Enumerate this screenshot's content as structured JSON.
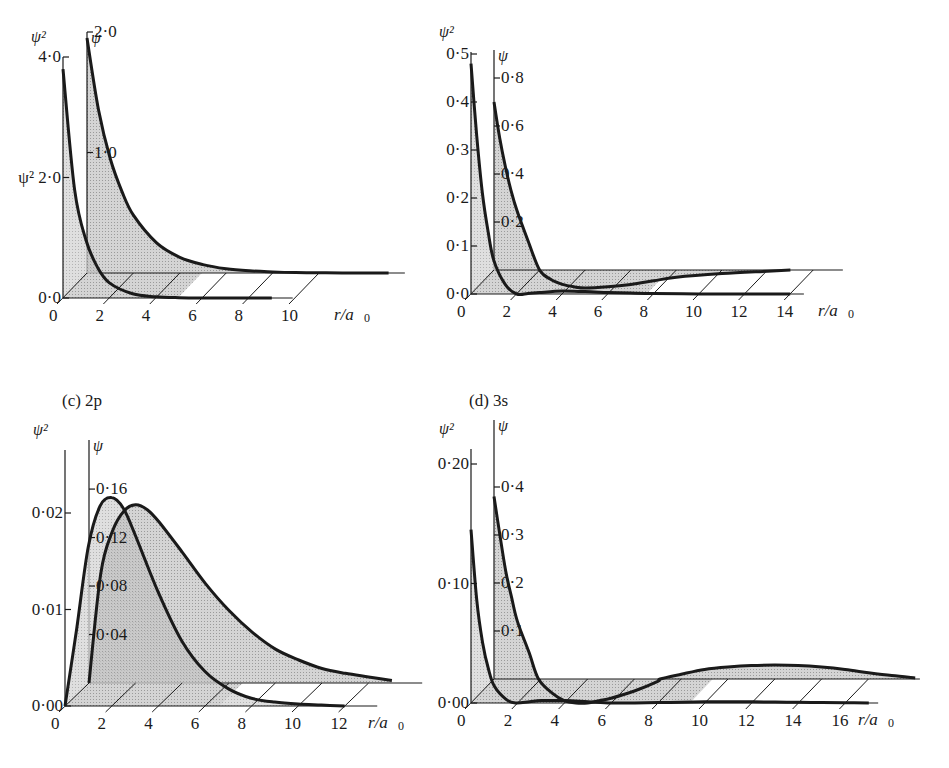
{
  "figure": {
    "panels": [
      {
        "id": "a",
        "title": "",
        "orbital": "1s"
      },
      {
        "id": "b",
        "title": "",
        "orbital": "2s"
      },
      {
        "id": "c",
        "title": "(c)  2p",
        "orbital": "2p"
      },
      {
        "id": "d",
        "title": "(d)  3s",
        "orbital": "3s"
      }
    ]
  },
  "chart_data": [
    {
      "type": "area",
      "panel": "a",
      "title": "1s",
      "xlabel": "r/a0",
      "x_ticks": [
        0,
        2,
        4,
        6,
        8,
        10
      ],
      "axes": {
        "psi_squared": {
          "label": "ψ²",
          "ticks": [
            0.0,
            2.0,
            4.0
          ],
          "tick_labels": [
            "0·0",
            "ψ² 2·0",
            "4·0"
          ],
          "range": [
            0,
            4.0
          ]
        },
        "psi": {
          "label": "ψ",
          "ticks": [
            1.0,
            2.0
          ],
          "tick_labels": [
            "1·0",
            "2·0"
          ],
          "range": [
            0,
            2.0
          ]
        }
      },
      "series": [
        {
          "name": "ψ²",
          "r": [
            0,
            0.5,
            1,
            1.5,
            2,
            3,
            4,
            5,
            6,
            7,
            8,
            9
          ],
          "values": [
            3.8,
            1.8,
            0.95,
            0.5,
            0.25,
            0.07,
            0.02,
            0.005,
            0.001,
            0,
            0,
            0
          ]
        },
        {
          "name": "ψ",
          "r": [
            0,
            0.5,
            1,
            1.5,
            2,
            3,
            4,
            5,
            6,
            7,
            8,
            9,
            10,
            11,
            13
          ],
          "values": [
            1.95,
            1.35,
            0.95,
            0.68,
            0.48,
            0.25,
            0.13,
            0.07,
            0.035,
            0.018,
            0.009,
            0.004,
            0.002,
            0.001,
            0
          ]
        }
      ]
    },
    {
      "type": "area",
      "panel": "b",
      "title": "2s",
      "xlabel": "r/a0",
      "x_ticks": [
        0,
        2,
        4,
        6,
        8,
        10,
        12,
        14
      ],
      "axes": {
        "psi_squared": {
          "label": "ψ²",
          "ticks": [
            0.0,
            0.1,
            0.2,
            0.3,
            0.4,
            0.5
          ],
          "tick_labels": [
            "0·0",
            "0·1",
            "0·2",
            "0·3",
            "0·4",
            "0·5"
          ],
          "range": [
            0,
            0.5
          ]
        },
        "psi": {
          "label": "ψ",
          "ticks": [
            0.2,
            0.4,
            0.6,
            0.8
          ],
          "tick_labels": [
            "0·2",
            "0·4",
            "0·6",
            "0·8"
          ],
          "range": [
            0,
            0.9
          ]
        }
      },
      "series": [
        {
          "name": "ψ²",
          "r": [
            0,
            0.25,
            0.5,
            0.75,
            1,
            1.5,
            2,
            2.5,
            3,
            4,
            5,
            6,
            7,
            8,
            10,
            12,
            14
          ],
          "values": [
            0.48,
            0.33,
            0.21,
            0.13,
            0.07,
            0.02,
            0.0,
            0.001,
            0.003,
            0.006,
            0.005,
            0.003,
            0.002,
            0.001,
            0.0,
            0.0,
            0.0
          ]
        },
        {
          "name": "ψ",
          "r": [
            0,
            0.25,
            0.5,
            0.75,
            1,
            1.5,
            2,
            2.5,
            3,
            3.5,
            4,
            5,
            6,
            7,
            8,
            10,
            12,
            13
          ],
          "values": [
            0.7,
            0.55,
            0.43,
            0.33,
            0.25,
            0.12,
            0.0,
            -0.04,
            -0.06,
            -0.07,
            -0.075,
            -0.07,
            -0.06,
            -0.045,
            -0.03,
            -0.015,
            -0.005,
            0.0
          ]
        }
      ]
    },
    {
      "type": "area",
      "panel": "c",
      "title": "(c) 2p",
      "xlabel": "r/a0",
      "x_ticks": [
        0,
        2,
        4,
        6,
        8,
        10,
        12
      ],
      "axes": {
        "psi_squared": {
          "label": "ψ²",
          "ticks": [
            0.0,
            0.01,
            0.02
          ],
          "tick_labels": [
            "0·00",
            "0·01",
            "0·02"
          ],
          "range": [
            0,
            0.025
          ]
        },
        "psi": {
          "label": "ψ",
          "ticks": [
            0.04,
            0.08,
            0.12,
            0.16
          ],
          "tick_labels": [
            "0·04",
            "0·08",
            "0·12",
            "0·16"
          ],
          "range": [
            0,
            0.2
          ]
        }
      },
      "series": [
        {
          "name": "ψ²",
          "r": [
            0,
            0.5,
            1,
            1.5,
            2,
            2.5,
            3,
            4,
            5,
            6,
            7,
            8,
            9,
            10,
            11,
            12
          ],
          "values": [
            0.0,
            0.008,
            0.0165,
            0.0207,
            0.0216,
            0.0205,
            0.0178,
            0.0118,
            0.0068,
            0.0036,
            0.0018,
            0.0008,
            0.0004,
            0.0002,
            0.0001,
            0.0
          ]
        },
        {
          "name": "ψ",
          "r": [
            0,
            0.5,
            1,
            1.5,
            2,
            2.5,
            3,
            4,
            5,
            6,
            7,
            8,
            9,
            10,
            11,
            12,
            13
          ],
          "values": [
            0.0,
            0.09,
            0.125,
            0.142,
            0.147,
            0.143,
            0.133,
            0.108,
            0.082,
            0.06,
            0.042,
            0.028,
            0.019,
            0.012,
            0.008,
            0.005,
            0.002
          ]
        }
      ]
    },
    {
      "type": "area",
      "panel": "d",
      "title": "(d) 3s",
      "xlabel": "r/a0",
      "x_ticks": [
        0,
        2,
        4,
        6,
        8,
        10,
        12,
        14,
        16
      ],
      "axes": {
        "psi_squared": {
          "label": "ψ²",
          "ticks": [
            0.0,
            0.1,
            0.2
          ],
          "tick_labels": [
            "0·00",
            "0·10",
            "0·20"
          ],
          "range": [
            0,
            0.2
          ]
        },
        "psi": {
          "label": "ψ",
          "ticks": [
            0.1,
            0.2,
            0.3,
            0.4
          ],
          "tick_labels": [
            "0·1",
            "0·2",
            "0·3",
            "0·4"
          ],
          "range": [
            0,
            0.45
          ]
        }
      },
      "series": [
        {
          "name": "ψ²",
          "r": [
            0,
            0.25,
            0.5,
            0.75,
            1,
            1.5,
            1.9,
            2.5,
            3,
            4,
            5,
            6,
            7,
            8,
            9,
            10,
            11,
            12,
            13,
            14,
            15,
            16,
            17
          ],
          "values": [
            0.145,
            0.085,
            0.05,
            0.028,
            0.014,
            0.003,
            0.0,
            0.001,
            0.002,
            0.002,
            0.001,
            0.0,
            0.0,
            0.0003,
            0.0007,
            0.001,
            0.0011,
            0.001,
            0.0008,
            0.0006,
            0.0004,
            0.0002,
            0.0
          ]
        },
        {
          "name": "ψ",
          "r": [
            0,
            0.25,
            0.5,
            0.75,
            1,
            1.5,
            1.9,
            2.5,
            3,
            3.5,
            4,
            4.5,
            5,
            6,
            7,
            7.1,
            8,
            9,
            10,
            11,
            12,
            13,
            14,
            15,
            16,
            17,
            18
          ],
          "values": [
            0.38,
            0.3,
            0.225,
            0.17,
            0.12,
            0.055,
            0.0,
            -0.03,
            -0.045,
            -0.05,
            -0.05,
            -0.045,
            -0.04,
            -0.025,
            -0.005,
            0.0,
            0.01,
            0.02,
            0.025,
            0.028,
            0.029,
            0.028,
            0.025,
            0.02,
            0.013,
            0.007,
            0.002
          ]
        }
      ]
    }
  ],
  "layout": {
    "panels": [
      {
        "front": [
          63,
          298
        ],
        "back": [
          87,
          273
        ],
        "rpx": 23.2,
        "sq_px": 60.25,
        "psi_px": 120.5,
        "axis_top_sq": 57,
        "axis_top_psi": 32,
        "front_len": 9.9,
        "back_len": 13.7,
        "xlabel_pos": [
          334,
          306
        ]
      },
      {
        "front": [
          471,
          294
        ],
        "back": [
          494,
          270
        ],
        "rpx": 22.8,
        "sq_px": 480,
        "psi_px": 240,
        "axis_top_sq": 52,
        "axis_top_psi": 50,
        "front_len": 14.6,
        "back_len": 15.3,
        "xlabel_pos": [
          818,
          302
        ]
      },
      {
        "front": [
          65,
          706
        ],
        "back": [
          89,
          683
        ],
        "rpx": 23.3,
        "sq_px": 9650,
        "psi_px": 1212,
        "axis_top_sq": 450,
        "axis_top_psi": 440,
        "front_len": 13.4,
        "back_len": 14.3,
        "xlabel_pos": [
          368,
          714
        ]
      },
      {
        "front": [
          471,
          703
        ],
        "back": [
          494,
          679
        ],
        "rpx": 23.4,
        "sq_px": 1195,
        "psi_px": 480,
        "axis_top_sq": 449,
        "axis_top_psi": 420,
        "front_len": 17.4,
        "back_len": 18.2,
        "xlabel_pos": [
          858,
          711
        ]
      }
    ],
    "colors": {
      "ink": "#1a1a1a",
      "fill_light": "#d4d4d4",
      "fill_dark": "#a8a8a8",
      "paper": "#ffffff"
    }
  }
}
